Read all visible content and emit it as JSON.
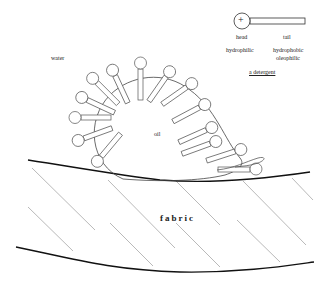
{
  "diagram": {
    "labels": {
      "water": "water",
      "oil": "oil",
      "fabric": "fabric",
      "head": "head",
      "tail": "tail",
      "hydrophilic": "hydrophilic",
      "hydrophobic": "hydrophobic",
      "oleophilic": "oleophilic",
      "detergent": "a detergent",
      "plus": "+"
    },
    "legend": {
      "head_symbol": "+",
      "head_center": [
        242,
        21
      ],
      "tail_end": [
        305,
        21
      ]
    },
    "colors": {
      "line": "#333333",
      "fabric_edge": "#111111",
      "hatch": "#888888"
    }
  }
}
